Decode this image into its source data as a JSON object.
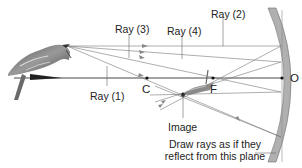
{
  "diagram": {
    "type": "concave-mirror-ray-diagram",
    "labels": {
      "ray1": "Ray (1)",
      "ray2": "Ray (2)",
      "ray3": "Ray (3)",
      "ray4": "Ray (4)",
      "center_of_curvature": "C",
      "focal_point": "F",
      "vertex": "O",
      "image": "Image",
      "note_line1": "Draw rays as if they",
      "note_line2": "reflect from this plane"
    },
    "objects": {
      "object": "bird (upright, left of C)",
      "image": "bird (inverted, between C and F)",
      "mirror": "concave mirror"
    },
    "colors": {
      "ray": "#777777",
      "axis": "#333333",
      "mirror_fill": "#b0b0b0",
      "mirror_edge": "#6e6e6e",
      "text": "#222222"
    }
  }
}
